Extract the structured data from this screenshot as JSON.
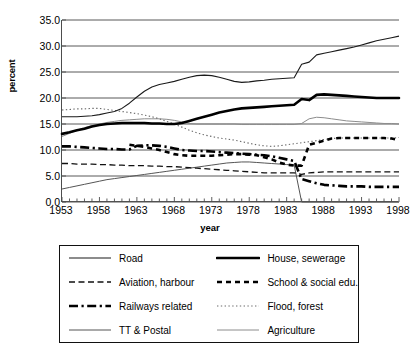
{
  "chart_data": {
    "type": "line",
    "title": "",
    "xlabel": "year",
    "ylabel": "percent",
    "xlim": [
      1953,
      1998
    ],
    "ylim": [
      0.0,
      35.0
    ],
    "ytick_step": 5.0,
    "grid": "horizontal",
    "legend_position": "below-plot",
    "ytick_labels": [
      "35.0",
      "30.0",
      "25.0",
      "20.0",
      "15.0",
      "10.0",
      "5.0",
      "0.0"
    ],
    "ytick_values": [
      35.0,
      30.0,
      25.0,
      20.0,
      15.0,
      10.0,
      5.0,
      0.0
    ],
    "xtick_labels": [
      "1953",
      "1958",
      "1963",
      "1968",
      "1973",
      "1978",
      "1983",
      "1988",
      "1993",
      "1998"
    ],
    "xtick_values": [
      1953,
      1958,
      1963,
      1968,
      1973,
      1978,
      1983,
      1988,
      1993,
      1998
    ],
    "x": [
      1953,
      1954,
      1955,
      1956,
      1957,
      1958,
      1959,
      1960,
      1961,
      1962,
      1963,
      1964,
      1965,
      1966,
      1967,
      1968,
      1969,
      1970,
      1971,
      1972,
      1973,
      1974,
      1975,
      1976,
      1977,
      1978,
      1979,
      1980,
      1981,
      1982,
      1983,
      1984,
      1985,
      1986,
      1987,
      1988,
      1989,
      1990,
      1991,
      1992,
      1993,
      1994,
      1995,
      1996,
      1997,
      1998
    ],
    "series": [
      {
        "name": "Road",
        "style": "solid-thin",
        "color": "#1a1a1a",
        "values": [
          16.4,
          16.4,
          16.4,
          16.5,
          16.6,
          16.8,
          17.1,
          17.4,
          18.0,
          19.0,
          20.2,
          21.3,
          22.1,
          22.6,
          22.9,
          23.2,
          23.6,
          24.0,
          24.3,
          24.4,
          24.3,
          24.0,
          23.6,
          23.2,
          23.0,
          23.1,
          23.3,
          23.4,
          23.6,
          23.7,
          23.8,
          23.9,
          26.5,
          26.9,
          28.3,
          28.6,
          28.9,
          29.2,
          29.5,
          29.8,
          30.2,
          30.6,
          31.0,
          31.3,
          31.6,
          31.9
        ]
      },
      {
        "name": "House, sewerage",
        "style": "solid-thick",
        "color": "#000000",
        "values": [
          13.1,
          13.4,
          13.8,
          14.1,
          14.5,
          14.8,
          15.0,
          15.1,
          15.2,
          15.2,
          15.2,
          15.2,
          15.1,
          15.1,
          15.0,
          15.0,
          15.2,
          15.6,
          16.0,
          16.4,
          16.8,
          17.2,
          17.5,
          17.8,
          18.0,
          18.1,
          18.2,
          18.3,
          18.4,
          18.5,
          18.6,
          18.7,
          19.8,
          19.6,
          20.6,
          20.7,
          20.6,
          20.5,
          20.4,
          20.3,
          20.2,
          20.1,
          20.0,
          20.0,
          20.0,
          20.0
        ]
      },
      {
        "name": "Aviation, harbour",
        "style": "dashed-thin",
        "color": "#111111",
        "values": [
          7.4,
          7.4,
          7.3,
          7.3,
          7.3,
          7.2,
          7.2,
          7.1,
          7.1,
          7.0,
          7.0,
          7.0,
          6.9,
          6.9,
          6.8,
          6.8,
          6.7,
          6.6,
          6.5,
          6.4,
          6.3,
          6.2,
          6.1,
          6.0,
          5.9,
          5.8,
          5.7,
          5.6,
          5.6,
          5.6,
          5.6,
          5.6,
          5.3,
          5.6,
          5.7,
          5.8,
          5.8,
          5.8,
          5.8,
          5.8,
          5.8,
          5.8,
          5.8,
          5.8,
          5.8,
          5.8
        ]
      },
      {
        "name": "School &  social edu.",
        "style": "dashed-thick",
        "color": "#000000",
        "values": [
          null,
          null,
          null,
          null,
          null,
          null,
          null,
          null,
          null,
          11.0,
          10.8,
          10.6,
          10.3,
          10.0,
          9.6,
          9.2,
          9.0,
          8.9,
          8.9,
          8.9,
          8.9,
          9.0,
          9.1,
          9.2,
          9.2,
          9.1,
          9.0,
          8.6,
          8.2,
          7.6,
          7.2,
          7.0,
          7.0,
          11.0,
          11.4,
          11.8,
          12.2,
          12.3,
          12.3,
          12.3,
          12.3,
          12.3,
          12.3,
          12.3,
          12.2,
          11.9
        ]
      },
      {
        "name": "Railways related",
        "style": "dashdot-thick",
        "color": "#000000",
        "values": [
          10.7,
          10.7,
          10.6,
          10.5,
          10.4,
          10.3,
          10.2,
          10.2,
          10.1,
          10.1,
          10.8,
          10.9,
          10.9,
          10.8,
          10.6,
          10.3,
          10.0,
          9.9,
          9.8,
          9.8,
          9.7,
          9.6,
          9.5,
          9.4,
          9.3,
          9.2,
          9.1,
          9.0,
          8.8,
          8.5,
          8.2,
          7.9,
          4.4,
          4.0,
          3.6,
          3.3,
          3.2,
          3.1,
          3.0,
          3.0,
          3.0,
          2.9,
          2.9,
          2.9,
          2.9,
          2.9
        ]
      },
      {
        "name": "Flood, forest",
        "style": "dotted-thin",
        "color": "#6b6b6b",
        "values": [
          17.7,
          17.8,
          17.9,
          17.9,
          18.0,
          18.0,
          17.8,
          17.6,
          17.4,
          17.2,
          17.0,
          16.7,
          16.4,
          16.0,
          15.5,
          15.0,
          14.4,
          13.8,
          13.3,
          12.9,
          12.6,
          12.3,
          12.1,
          11.9,
          11.6,
          11.3,
          11.0,
          10.8,
          10.7,
          10.8,
          11.0,
          11.2,
          11.4,
          11.6,
          11.8,
          12.0,
          12.2,
          12.3,
          12.3,
          12.3,
          12.3,
          12.3,
          12.3,
          12.3,
          12.3,
          12.4
        ]
      },
      {
        "name": "TT & Postal",
        "style": "solid-thin-gray",
        "color": "#555555",
        "values": [
          2.5,
          2.8,
          3.1,
          3.4,
          3.7,
          4.0,
          4.3,
          4.5,
          4.7,
          4.9,
          5.1,
          5.3,
          5.5,
          5.7,
          5.9,
          6.1,
          6.3,
          6.5,
          6.7,
          6.9,
          7.1,
          7.3,
          7.5,
          7.6,
          7.7,
          7.7,
          7.6,
          7.5,
          7.4,
          7.3,
          7.2,
          7.1,
          0.0,
          0.0,
          0.0,
          0.0,
          0.0,
          0.0,
          0.0,
          0.0,
          0.0,
          0.0,
          0.0,
          0.0,
          0.0,
          0.0
        ]
      },
      {
        "name": "Agriculture",
        "style": "solid-thin-gray2",
        "color": "#8c8c8c",
        "values": [
          12.6,
          13.2,
          13.8,
          14.3,
          14.7,
          15.0,
          15.3,
          15.5,
          15.7,
          15.8,
          15.9,
          16.0,
          16.0,
          16.0,
          15.9,
          15.7,
          15.4,
          15.1,
          15.0,
          15.0,
          15.0,
          15.0,
          15.0,
          15.0,
          14.9,
          14.9,
          14.9,
          14.9,
          14.9,
          14.9,
          14.9,
          14.9,
          15.1,
          16.0,
          16.3,
          16.2,
          16.0,
          15.8,
          15.6,
          15.5,
          15.4,
          15.3,
          15.2,
          15.1,
          15.1,
          15.0
        ]
      }
    ]
  },
  "legend": {
    "items": [
      {
        "label": "Road",
        "style": "solid-thin",
        "column": "left"
      },
      {
        "label": "House, sewerage",
        "style": "solid-thick",
        "column": "right"
      },
      {
        "label": "Aviation, harbour",
        "style": "dashed-thin",
        "column": "left"
      },
      {
        "label": "School &  social edu.",
        "style": "dashed-thick",
        "column": "right"
      },
      {
        "label": "Railways related",
        "style": "dashdot-thick",
        "column": "left"
      },
      {
        "label": "Flood, forest",
        "style": "dotted-thin",
        "column": "right"
      },
      {
        "label": "TT & Postal",
        "style": "solid-thin-gray",
        "column": "left"
      },
      {
        "label": "Agriculture",
        "style": "solid-thin-gray2",
        "column": "right"
      }
    ]
  }
}
